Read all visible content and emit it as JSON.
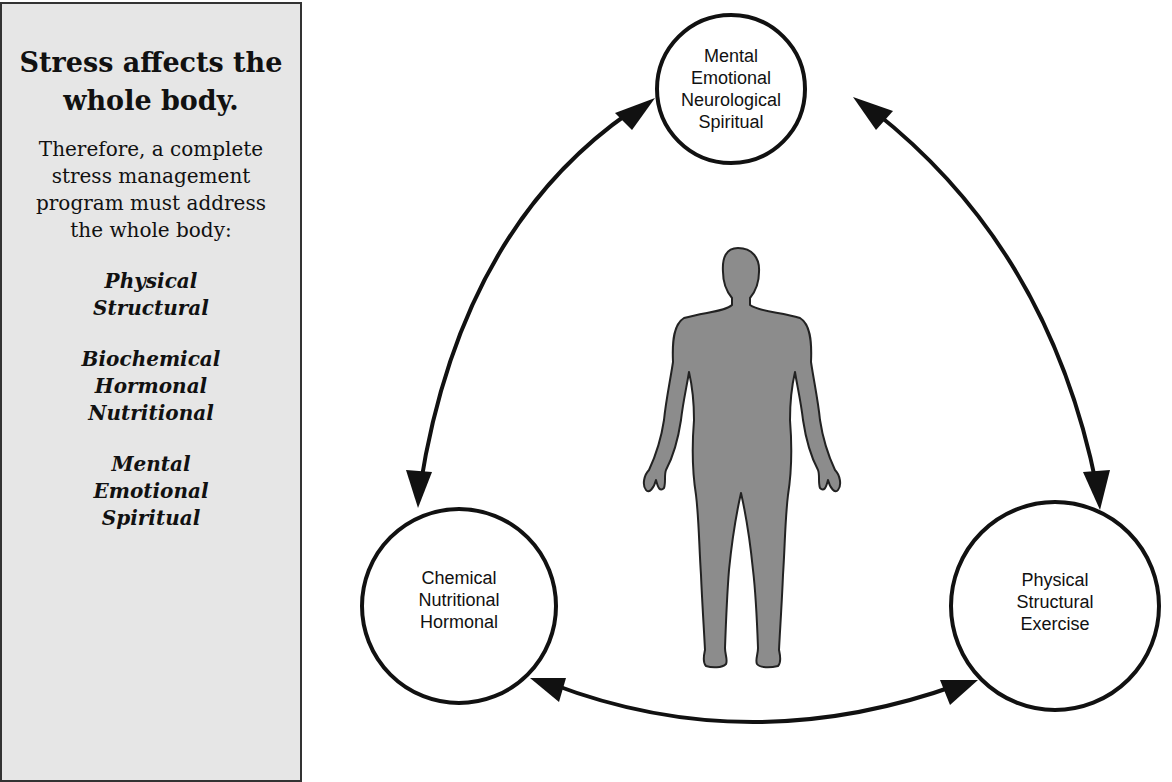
{
  "sidebar": {
    "heading": "Stress affects the whole body.",
    "heading_lines": [
      "Stress affects the",
      "whole body."
    ],
    "intro_lines": [
      "Therefore, a complete",
      "stress management",
      "program must address",
      "the whole body:"
    ],
    "groups": [
      [
        "Physical",
        "Structural"
      ],
      [
        "Biochemical",
        "Hormonal",
        "Nutritional"
      ],
      [
        "Mental",
        "Emotional",
        "Spiritual"
      ]
    ]
  },
  "diagram": {
    "center_figure": "human-body-silhouette",
    "nodes": {
      "top": [
        "Mental",
        "Emotional",
        "Neurological",
        "Spiritual"
      ],
      "left": [
        "Chemical",
        "Nutritional",
        "Hormonal"
      ],
      "right": [
        "Physical",
        "Structural",
        "Exercise"
      ]
    },
    "connections": [
      {
        "from": "top",
        "to": "left",
        "type": "bidirectional-arrow"
      },
      {
        "from": "top",
        "to": "right",
        "type": "bidirectional-arrow"
      },
      {
        "from": "left",
        "to": "right",
        "type": "bidirectional-arrow"
      }
    ],
    "colors": {
      "figure_fill": "#8c8c8c",
      "stroke": "#111111",
      "sidebar_bg": "#e6e6e6"
    }
  }
}
